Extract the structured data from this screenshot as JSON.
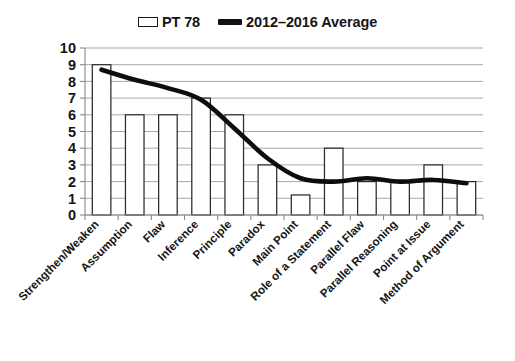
{
  "legend": {
    "entries": [
      {
        "label": "PT 78",
        "marker": "bar-swatch-icon",
        "color": "#ffffff",
        "border": "#1a1a1a"
      },
      {
        "label": "2012–2016 Average",
        "marker": "line-swatch-icon",
        "color": "#111111"
      }
    ],
    "position": "top-center"
  },
  "chart_data": {
    "type": "bar",
    "title": "",
    "subtitle": "",
    "xlabel": "",
    "ylabel": "",
    "ylim": [
      0,
      10
    ],
    "yticks": [
      "0",
      "1",
      "2",
      "3",
      "4",
      "5",
      "6",
      "7",
      "8",
      "9",
      "10"
    ],
    "grid": true,
    "legend_position": "top-center",
    "categories": [
      "Strengthen/Weaken",
      "Assumption",
      "Flaw",
      "Inference",
      "Principle",
      "Paradox",
      "Main Point",
      "Role of a Statement",
      "Parallel Flaw",
      "Parallel Reasoning",
      "Point at Issue",
      "Method of Argument"
    ],
    "series": [
      {
        "name": "PT 78",
        "type": "bar",
        "color": "#ffffff",
        "edgecolor": "#2b2b2b",
        "values": [
          9,
          6,
          6,
          7,
          6,
          3,
          1.2,
          4,
          2,
          2,
          3,
          2
        ]
      },
      {
        "name": "2012–2016 Average",
        "type": "line",
        "color": "#0d0d0d",
        "values": [
          8.7,
          8.1,
          7.6,
          6.9,
          5.2,
          3.4,
          2.2,
          2.0,
          2.2,
          2.0,
          2.1,
          1.9
        ]
      }
    ]
  }
}
